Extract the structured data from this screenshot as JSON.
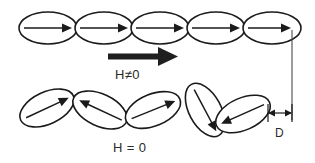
{
  "figure": {
    "background_color": "#ffffff",
    "stroke_color": "#1a1a1a",
    "width": 315,
    "height": 163
  },
  "labels": {
    "field_on": "H≠0",
    "field_off": "H = 0",
    "dimension": "D"
  },
  "rows": [
    {
      "name": "aligned-row",
      "state_label": "H≠0",
      "description": "Five horizontal ellipses in a straight chain, all magnetization arrows pointing right",
      "ellipse_count": 5,
      "ellipse_rx": 29,
      "ellipse_ry": 16,
      "center_y": 28,
      "centers_x": [
        48,
        104,
        160,
        216,
        272
      ],
      "rotations": [
        0,
        0,
        0,
        0,
        0
      ],
      "arrow_directions": [
        "right",
        "right",
        "right",
        "right",
        "right"
      ]
    },
    {
      "name": "random-row",
      "state_label": "H = 0",
      "description": "Five tilted ellipses in a zig-zag chain with randomly oriented magnetization arrows",
      "ellipse_count": 5,
      "ellipse_rx": 29,
      "ellipse_ry": 16,
      "centers": [
        {
          "cx": 47,
          "cy": 108,
          "rotation": -25,
          "arrow": "up-right"
        },
        {
          "cx": 100,
          "cy": 110,
          "rotation": 25,
          "arrow": "up-left"
        },
        {
          "cx": 153,
          "cy": 110,
          "rotation": -22,
          "arrow": "up-right"
        },
        {
          "cx": 205,
          "cy": 110,
          "rotation": 62,
          "arrow": "down-right"
        },
        {
          "cx": 243,
          "cy": 114,
          "rotation": -24,
          "arrow": "down-left"
        }
      ]
    }
  ],
  "field_arrow": {
    "name": "applied-field-arrow",
    "direction": "right",
    "x_start": 108,
    "x_end": 178,
    "y": 57,
    "style": "thick-solid-black"
  },
  "reference_line": {
    "name": "right-edge-reference-line",
    "x": 292,
    "y_start": 30,
    "y_end": 120
  },
  "dimension": {
    "name": "length-change-D",
    "label": "D",
    "x_start": 268,
    "x_end": 292,
    "y": 113,
    "tick_top": 104,
    "tick_bottom": 122,
    "label_x": 280,
    "label_y": 134
  }
}
